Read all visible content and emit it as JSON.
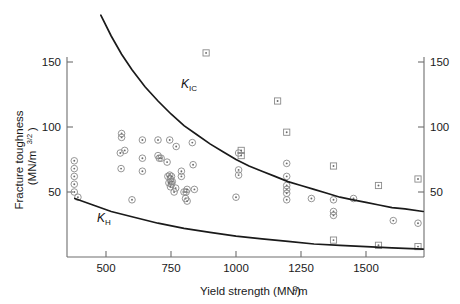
{
  "chart_data": {
    "type": "scatter",
    "title": "",
    "xlabel": "Yield strength (MN/m2)",
    "xlabel_main": "Yield strength (MN/m",
    "xlabel_sup": "2",
    "xlabel_tail": ")",
    "ylabel_line1": "Fracture toughness",
    "ylabel_line2_main": "(MN/m",
    "ylabel_line2_sup": "3/2",
    "ylabel_line2_tail": ")",
    "xlim": [
      350,
      1720
    ],
    "ylim": [
      0,
      165
    ],
    "xticks": [
      500,
      750,
      1000,
      1250,
      1500
    ],
    "xtick_labels": [
      "500",
      "750",
      "1000",
      "1250",
      "1500"
    ],
    "yticks": [
      50,
      100,
      150
    ],
    "ytick_labels": [
      "50",
      "100",
      "150"
    ],
    "right_yticks": [
      50,
      100,
      150
    ],
    "right_ytick_labels": [
      "50",
      "100",
      "150"
    ],
    "grid": false,
    "legend_position": "none",
    "annotations": [
      {
        "name": "kic-label",
        "text": "K",
        "sub": "IC",
        "x": 905,
        "y": 122
      },
      {
        "name": "kh-label",
        "text": "K",
        "sub": "H",
        "x": 560,
        "y": 26
      }
    ],
    "series": [
      {
        "name": "K_IC upper bound curve",
        "type": "line",
        "label": "KIC",
        "points": [
          [
            480,
            186
          ],
          [
            520,
            170
          ],
          [
            560,
            156
          ],
          [
            600,
            144
          ],
          [
            650,
            131
          ],
          [
            700,
            120
          ],
          [
            750,
            110
          ],
          [
            800,
            101
          ],
          [
            850,
            94
          ],
          [
            900,
            87
          ],
          [
            950,
            81
          ],
          [
            1000,
            75
          ],
          [
            1050,
            70
          ],
          [
            1100,
            66
          ],
          [
            1150,
            62
          ],
          [
            1200,
            58
          ],
          [
            1250,
            55
          ],
          [
            1300,
            52
          ],
          [
            1350,
            49
          ],
          [
            1400,
            46
          ],
          [
            1450,
            44
          ],
          [
            1500,
            42
          ],
          [
            1550,
            40
          ],
          [
            1600,
            38
          ],
          [
            1650,
            37
          ],
          [
            1720,
            35
          ]
        ]
      },
      {
        "name": "K_H lower bound curve",
        "type": "line",
        "label": "KH",
        "points": [
          [
            380,
            45
          ],
          [
            450,
            40
          ],
          [
            520,
            35
          ],
          [
            600,
            31
          ],
          [
            700,
            26
          ],
          [
            800,
            22
          ],
          [
            900,
            19
          ],
          [
            1000,
            16
          ],
          [
            1100,
            14
          ],
          [
            1200,
            12
          ],
          [
            1300,
            10
          ],
          [
            1400,
            9
          ],
          [
            1500,
            8
          ],
          [
            1600,
            7
          ],
          [
            1720,
            6
          ]
        ]
      },
      {
        "name": "circle-dot data points",
        "type": "scatter",
        "marker": "circle-dot",
        "points": [
          [
            378,
            74
          ],
          [
            378,
            68
          ],
          [
            378,
            62
          ],
          [
            378,
            56
          ],
          [
            378,
            50
          ],
          [
            392,
            46
          ],
          [
            560,
            95
          ],
          [
            560,
            92
          ],
          [
            555,
            80
          ],
          [
            572,
            82
          ],
          [
            558,
            68
          ],
          [
            600,
            44
          ],
          [
            640,
            90
          ],
          [
            640,
            76
          ],
          [
            640,
            66
          ],
          [
            700,
            90
          ],
          [
            700,
            78
          ],
          [
            705,
            76
          ],
          [
            712,
            76
          ],
          [
            735,
            73
          ],
          [
            745,
            90
          ],
          [
            745,
            63
          ],
          [
            748,
            60
          ],
          [
            750,
            58
          ],
          [
            752,
            56
          ],
          [
            748,
            54
          ],
          [
            755,
            58
          ],
          [
            742,
            57
          ],
          [
            738,
            62
          ],
          [
            752,
            62
          ],
          [
            762,
            50
          ],
          [
            768,
            53
          ],
          [
            770,
            85
          ],
          [
            790,
            66
          ],
          [
            790,
            62
          ],
          [
            800,
            50
          ],
          [
            808,
            50
          ],
          [
            812,
            52
          ],
          [
            806,
            45
          ],
          [
            812,
            43
          ],
          [
            832,
            88
          ],
          [
            835,
            71
          ],
          [
            840,
            52
          ],
          [
            1010,
            80
          ],
          [
            1010,
            67
          ],
          [
            1010,
            63
          ],
          [
            1000,
            46
          ],
          [
            1195,
            72
          ],
          [
            1195,
            62
          ],
          [
            1195,
            55
          ],
          [
            1195,
            52
          ],
          [
            1195,
            49
          ],
          [
            1195,
            44
          ],
          [
            1290,
            45
          ],
          [
            1375,
            44
          ],
          [
            1375,
            35
          ],
          [
            1375,
            32
          ],
          [
            1452,
            45
          ],
          [
            1605,
            28
          ],
          [
            1700,
            26
          ]
        ]
      },
      {
        "name": "square-dot data points",
        "type": "scatter",
        "marker": "square-dot",
        "points": [
          [
            885,
            157
          ],
          [
            1160,
            120
          ],
          [
            1020,
            82
          ],
          [
            1020,
            78
          ],
          [
            1195,
            96
          ],
          [
            1375,
            70
          ],
          [
            1548,
            55
          ],
          [
            1700,
            60
          ],
          [
            1375,
            13
          ],
          [
            1548,
            9
          ],
          [
            1700,
            8
          ]
        ]
      }
    ]
  },
  "axis": {
    "left_label_top": "150",
    "left_label_mid": "100",
    "left_label_bot": "50"
  }
}
